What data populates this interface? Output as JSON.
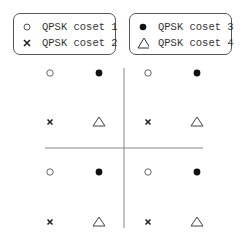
{
  "legend": [
    {
      "symbol": "open-circle",
      "label": "QPSK coset 1"
    },
    {
      "symbol": "cross",
      "label": "QPSK coset 2"
    },
    {
      "symbol": "filled-circle",
      "label": "QPSK coset 3"
    },
    {
      "symbol": "open-triangle",
      "label": "QPSK coset 4"
    }
  ],
  "constellation": {
    "columns_per_quadrant": [
      "coset1_or_coset2",
      "coset3_or_coset4"
    ],
    "rows": [
      [
        "open-circle",
        "filled-circle",
        "open-circle",
        "filled-circle"
      ],
      [
        "cross",
        "open-triangle",
        "cross",
        "open-triangle"
      ],
      [
        "open-circle",
        "filled-circle",
        "open-circle",
        "filled-circle"
      ],
      [
        "cross",
        "open-triangle",
        "cross",
        "open-triangle"
      ]
    ]
  },
  "colors": {
    "stroke": "#333333",
    "axis": "#888888",
    "border": "#555555"
  }
}
